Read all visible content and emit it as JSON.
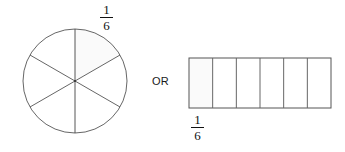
{
  "figure": {
    "connector_label": "OR",
    "stroke_color": "#555555",
    "shade_color": "#fafafa",
    "background_color": "#ffffff"
  },
  "circle_model": {
    "name": "circle-fraction-model",
    "total_parts": 6,
    "shaded_parts": 1,
    "shaded_part_index": 1,
    "center_x": 75,
    "center_y": 81,
    "radius": 52,
    "divider_angles_deg": [
      90,
      30,
      330
    ],
    "label": {
      "numerator": "1",
      "denominator": "6",
      "text": "1/6"
    }
  },
  "bar_model": {
    "name": "bar-fraction-model",
    "total_parts": 6,
    "shaded_parts": 1,
    "shaded_part_index": 1,
    "x": 189,
    "y": 58,
    "width": 142,
    "height": 50,
    "cell_width": 23.67,
    "label": {
      "numerator": "1",
      "denominator": "6",
      "text": "1/6"
    }
  }
}
